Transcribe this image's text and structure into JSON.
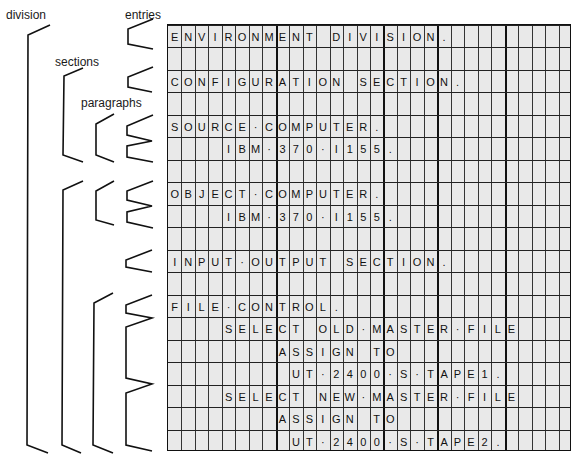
{
  "labels": {
    "division": "division",
    "sections": "sections",
    "paragraphs": "paragraphs",
    "entries": "entries"
  },
  "form": {
    "columns": 30,
    "rows": 19,
    "thick_column_lines_after": [
      8,
      16,
      20,
      25
    ],
    "lines": [
      {
        "start": 1,
        "text": "ENVIRONMENT DIVISION."
      },
      {
        "start": 1,
        "text": ""
      },
      {
        "start": 1,
        "text": "CONFIGURATION SECTION."
      },
      {
        "start": 1,
        "text": ""
      },
      {
        "start": 1,
        "text": "SOURCE-COMPUTER."
      },
      {
        "start": 5,
        "text": "IBM-370-I155."
      },
      {
        "start": 1,
        "text": ""
      },
      {
        "start": 1,
        "text": "OBJECT-COMPUTER."
      },
      {
        "start": 5,
        "text": "IBM-370-I155."
      },
      {
        "start": 1,
        "text": ""
      },
      {
        "start": 1,
        "text": "INPUT-OUTPUT SECTION."
      },
      {
        "start": 1,
        "text": ""
      },
      {
        "start": 1,
        "text": "FILE-CONTROL."
      },
      {
        "start": 5,
        "text": "SELECT OLD-MASTER-FILE"
      },
      {
        "start": 9,
        "text": "ASSIGN TO"
      },
      {
        "start": 10,
        "text": "UT-2400-S-TAPE1."
      },
      {
        "start": 5,
        "text": "SELECT NEW-MASTER-FILE"
      },
      {
        "start": 9,
        "text": "ASSIGN TO"
      },
      {
        "start": 10,
        "text": "UT-2400-S-TAPE2."
      }
    ]
  },
  "colors": {
    "form_background": "#e9e9e9",
    "grid_line": "#222222",
    "ink": "#111111"
  }
}
